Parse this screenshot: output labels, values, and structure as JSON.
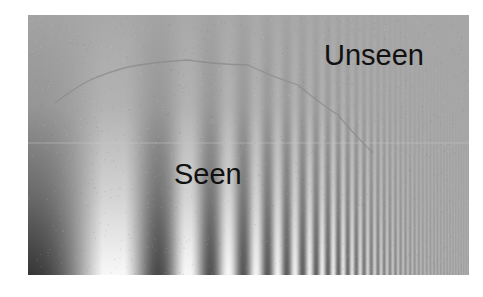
{
  "figure": {
    "kind": "Campbell-Robson contrast sensitivity chart",
    "labels": {
      "unseen": "Unseen",
      "seen": "Seen"
    },
    "colors": {
      "background": "#ffffff",
      "mid_gray": "#a6a6a6",
      "dark": "#1a1a1a",
      "light": "#f2f2f2",
      "curve": "#8a8a8a",
      "text": "#111111"
    },
    "grating": {
      "x_axis": "spatial frequency (increasing left to right, logarithmic sweep)",
      "y_axis": "contrast (increasing top to bottom)",
      "start_cycles_per_px": 0.0035,
      "end_cycles_per_px": 0.42
    },
    "threshold_curve": {
      "description": "inverted-U boundary between seen and unseen regions",
      "points": [
        [
          27,
          88
        ],
        [
          60,
          66
        ],
        [
          100,
          52
        ],
        [
          160,
          45
        ],
        [
          220,
          50
        ],
        [
          270,
          70
        ],
        [
          310,
          100
        ],
        [
          345,
          138
        ]
      ]
    }
  }
}
